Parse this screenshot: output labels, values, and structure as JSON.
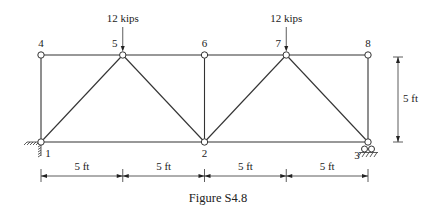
{
  "figure": {
    "caption": "Figure S4.8",
    "type": "truss"
  },
  "nodes": [
    {
      "id": "1",
      "label": "1",
      "bay": 0,
      "level": "bottom"
    },
    {
      "id": "2",
      "label": "2",
      "bay": 2,
      "level": "bottom"
    },
    {
      "id": "3",
      "label": "3",
      "bay": 4,
      "level": "bottom"
    },
    {
      "id": "4",
      "label": "4",
      "bay": 0,
      "level": "top"
    },
    {
      "id": "5",
      "label": "5",
      "bay": 1,
      "level": "top"
    },
    {
      "id": "6",
      "label": "6",
      "bay": 2,
      "level": "top"
    },
    {
      "id": "7",
      "label": "7",
      "bay": 3,
      "level": "top"
    },
    {
      "id": "8",
      "label": "8",
      "bay": 4,
      "level": "top"
    }
  ],
  "members": [
    [
      "1",
      "2"
    ],
    [
      "2",
      "3"
    ],
    [
      "4",
      "5"
    ],
    [
      "5",
      "6"
    ],
    [
      "6",
      "7"
    ],
    [
      "7",
      "8"
    ],
    [
      "1",
      "4"
    ],
    [
      "2",
      "6"
    ],
    [
      "3",
      "8"
    ],
    [
      "1",
      "5"
    ],
    [
      "5",
      "2"
    ],
    [
      "2",
      "7"
    ],
    [
      "7",
      "3"
    ]
  ],
  "supports": [
    {
      "node": "1",
      "type": "pin",
      "label": "pin-support"
    },
    {
      "node": "3",
      "type": "roller",
      "label": "roller-support"
    }
  ],
  "loads": [
    {
      "node": "5",
      "label": "12 kips",
      "direction": "down"
    },
    {
      "node": "7",
      "label": "12 kips",
      "direction": "down"
    }
  ],
  "dimensions": {
    "horizontal": [
      "5 ft",
      "5 ft",
      "5 ft",
      "5 ft"
    ],
    "vertical": "5 ft"
  }
}
